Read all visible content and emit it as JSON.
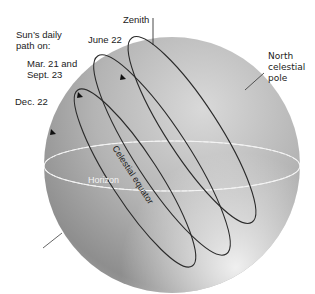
{
  "title_label": {
    "line1": "Sun’s daily",
    "line2": "path on:"
  },
  "paths": [
    {
      "id": "june",
      "label": "June 22"
    },
    {
      "id": "equinox",
      "label_line1": "Mar. 21 and",
      "label_line2": "Sept. 23"
    },
    {
      "id": "december",
      "label": "Dec. 22"
    }
  ],
  "zenith_label": "Zenith",
  "pole_label": {
    "line1": "North",
    "line2": "celestial",
    "line3": "pole"
  },
  "horizon_label": "Horizon",
  "equator_label": "Celestial equator",
  "colors": {
    "sphere_light": "#d6d6d6",
    "sphere_dark": "#8a8a8a",
    "path": "#2a2a2a",
    "horizon": "#f2f2f2"
  }
}
